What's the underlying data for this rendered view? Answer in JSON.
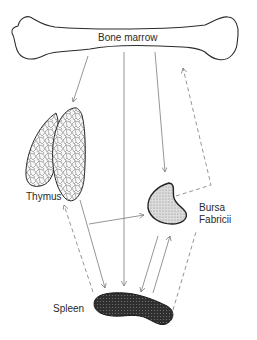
{
  "diagram": {
    "type": "lymphoid organ cell migration diagram",
    "nodes": [
      {
        "id": "bone_marrow",
        "label": "Bone marrow",
        "shape": "long bone outline"
      },
      {
        "id": "thymus",
        "label": "Thymus",
        "shape": "bilobed organ with cellular mesh pattern"
      },
      {
        "id": "bursa",
        "label_line1": "Bursa",
        "label_line2": "Fabricii",
        "shape": "kidney-shaped, light stippled fill"
      },
      {
        "id": "spleen",
        "label": "Spleen",
        "shape": "elongated, dark stippled fill"
      }
    ],
    "edges": [
      {
        "from": "bone_marrow",
        "to": "thymus",
        "style": "solid"
      },
      {
        "from": "bone_marrow",
        "to": "spleen",
        "style": "solid"
      },
      {
        "from": "bone_marrow",
        "to": "bursa",
        "style": "solid"
      },
      {
        "from": "bursa",
        "to": "bone_marrow",
        "style": "dashed"
      },
      {
        "from": "thymus",
        "to": "bursa",
        "style": "solid"
      },
      {
        "from": "thymus",
        "to": "spleen",
        "style": "solid"
      },
      {
        "from": "spleen",
        "to": "thymus",
        "style": "dashed"
      },
      {
        "from": "bursa",
        "to": "spleen",
        "style": "solid"
      },
      {
        "from": "spleen",
        "to": "bursa",
        "style": "solid"
      }
    ],
    "colors": {
      "outline": "#2b2b2b",
      "arrow": "#7a7a7a",
      "bursa_fill": "#cfcfcf",
      "spleen_fill": "#3a3a3a",
      "thymus_fill": "#f4f4f4"
    }
  }
}
